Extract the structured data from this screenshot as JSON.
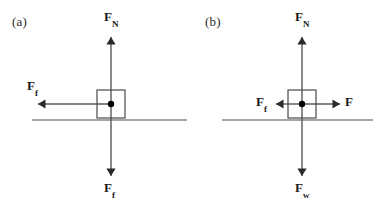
{
  "figure": {
    "width": 390,
    "height": 205,
    "background": "#ffffff",
    "stroke_color": "#4a4a4a",
    "arrow_color": "#5a5a5a",
    "text_color": "#1a1a1a"
  },
  "panels": [
    {
      "id": "a",
      "label": "(a)",
      "ground_line": {
        "x1": 32,
        "x2": 187,
        "y": 120
      },
      "block": {
        "x": 97,
        "y": 90,
        "width": 28,
        "height": 28
      },
      "center_dot": {
        "cx": 111,
        "cy": 104,
        "r": 3.2
      },
      "forces": [
        {
          "name": "normal-force",
          "symbol": "F",
          "subscript": "N",
          "direction": "up",
          "label_x": 104,
          "label_y": 10,
          "arrow": {
            "x1": 111,
            "y1": 104,
            "x2": 111,
            "y2": 37
          }
        },
        {
          "name": "friction-force",
          "symbol": "F",
          "subscript": "f",
          "direction": "left",
          "label_x": 27,
          "label_y": 79,
          "arrow": {
            "x1": 111,
            "y1": 104,
            "x2": 38,
            "y2": 104
          }
        },
        {
          "name": "weight-force",
          "symbol": "F",
          "subscript": "f",
          "direction": "down",
          "label_x": 104,
          "label_y": 181,
          "arrow": {
            "x1": 111,
            "y1": 104,
            "x2": 111,
            "y2": 176
          }
        }
      ]
    },
    {
      "id": "b",
      "label": "(b)",
      "ground_line": {
        "x1": 27,
        "x2": 178,
        "y": 120
      },
      "block": {
        "x": 93,
        "y": 90,
        "width": 28,
        "height": 28
      },
      "center_dot": {
        "cx": 107,
        "cy": 104,
        "r": 3.2
      },
      "forces": [
        {
          "name": "normal-force",
          "symbol": "F",
          "subscript": "N",
          "direction": "up",
          "label_x": 100,
          "label_y": 10,
          "arrow": {
            "x1": 107,
            "y1": 104,
            "x2": 107,
            "y2": 37
          }
        },
        {
          "name": "friction-force",
          "symbol": "F",
          "subscript": "f",
          "direction": "left",
          "label_x": 61,
          "label_y": 95,
          "arrow": {
            "x1": 107,
            "y1": 104,
            "x2": 81,
            "y2": 104
          }
        },
        {
          "name": "applied-force",
          "symbol": "F",
          "subscript": "",
          "direction": "right",
          "label_x": 150,
          "label_y": 95,
          "arrow": {
            "x1": 107,
            "y1": 104,
            "x2": 145,
            "y2": 104
          }
        },
        {
          "name": "weight-force",
          "symbol": "F",
          "subscript": "w",
          "direction": "down",
          "label_x": 100,
          "label_y": 181,
          "arrow": {
            "x1": 107,
            "y1": 104,
            "x2": 107,
            "y2": 176
          }
        }
      ]
    }
  ]
}
